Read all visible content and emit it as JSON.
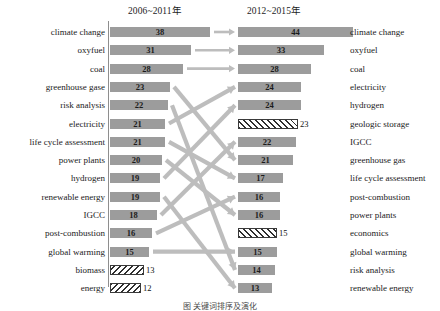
{
  "chart_data": {
    "type": "bar",
    "title": "",
    "subtitle": "",
    "xlabel": "",
    "ylabel": "",
    "grid": false,
    "legend_position": "none",
    "orientation": "horizontal",
    "layout": "slope-ranking-comparison",
    "panels": [
      {
        "name": "left",
        "header": "2006~2011年",
        "categories": [
          "climate change",
          "oxyfuel",
          "coal",
          "greenhouse gase",
          "risk analysis",
          "electricity",
          "life cycle assessment",
          "power plants",
          "hydrogen",
          "renewable energy",
          "IGCC",
          "post-combustion",
          "global warming",
          "biomass",
          "energy"
        ],
        "values": [
          38,
          31,
          28,
          23,
          22,
          21,
          21,
          20,
          19,
          19,
          18,
          16,
          15,
          13,
          12
        ],
        "styles": [
          "solid",
          "solid",
          "solid",
          "solid",
          "solid",
          "solid",
          "solid",
          "solid",
          "solid",
          "solid",
          "solid",
          "solid",
          "solid",
          "hatched",
          "hatched"
        ]
      },
      {
        "name": "right",
        "header": "2012~2015年",
        "categories": [
          "climate change",
          "oxyfuel",
          "coal",
          "electricity",
          "hydrogen",
          "geologic storage",
          "IGCC",
          "greenhouse gas",
          "life cycle assessment",
          "post-combustion",
          "power plants",
          "economics",
          "global warming",
          "risk analysis",
          "renewable energy"
        ],
        "values": [
          44,
          33,
          28,
          24,
          24,
          23,
          22,
          21,
          17,
          16,
          16,
          15,
          15,
          14,
          13
        ],
        "styles": [
          "solid",
          "solid",
          "solid",
          "solid",
          "solid",
          "solid",
          "solid",
          "solid",
          "solid",
          "solid",
          "solid",
          "hatched",
          "solid",
          "solid",
          "solid"
        ]
      }
    ],
    "links": [
      {
        "from": "climate change",
        "to": "climate change",
        "from_row": 0,
        "to_row": 0,
        "kind": "arrow"
      },
      {
        "from": "oxyfuel",
        "to": "oxyfuel",
        "from_row": 1,
        "to_row": 1,
        "kind": "arrow"
      },
      {
        "from": "coal",
        "to": "coal",
        "from_row": 2,
        "to_row": 2,
        "kind": "arrow"
      },
      {
        "from": "greenhouse gase",
        "to": "greenhouse gas",
        "from_row": 3,
        "to_row": 7,
        "kind": "ribbon"
      },
      {
        "from": "risk analysis",
        "to": "risk analysis",
        "from_row": 4,
        "to_row": 13,
        "kind": "ribbon"
      },
      {
        "from": "electricity",
        "to": "electricity",
        "from_row": 5,
        "to_row": 3,
        "kind": "ribbon"
      },
      {
        "from": "life cycle assessment",
        "to": "life cycle assessment",
        "from_row": 6,
        "to_row": 8,
        "kind": "ribbon"
      },
      {
        "from": "power plants",
        "to": "power plants",
        "from_row": 7,
        "to_row": 10,
        "kind": "ribbon"
      },
      {
        "from": "hydrogen",
        "to": "hydrogen",
        "from_row": 8,
        "to_row": 4,
        "kind": "ribbon"
      },
      {
        "from": "renewable energy",
        "to": "renewable energy",
        "from_row": 9,
        "to_row": 14,
        "kind": "ribbon"
      },
      {
        "from": "IGCC",
        "to": "IGCC",
        "from_row": 10,
        "to_row": 6,
        "kind": "ribbon"
      },
      {
        "from": "post-combustion",
        "to": "post-combustion",
        "from_row": 11,
        "to_row": 9,
        "kind": "ribbon"
      },
      {
        "from": "global warming",
        "to": "global warming",
        "from_row": 12,
        "to_row": 12,
        "kind": "ribbon"
      }
    ],
    "colors": {
      "bar_fill": "#9c9c9c",
      "link": "#bdbdbd",
      "hatch_stroke": "#2f2f2f",
      "axis": "#8e8e8e",
      "text": "#1a1a1a"
    },
    "notes": {
      "new_terms_right": [
        "geologic storage",
        "economics"
      ],
      "dropped_terms_left": [
        "biomass",
        "energy"
      ],
      "hatch_meaning": "hatched bars mark terms present in only one period"
    }
  },
  "headers": {
    "left": "2006~2011年",
    "right": "2012~2015年"
  },
  "rows_left": [
    {
      "label": "climate change",
      "value": "38",
      "style": "solid"
    },
    {
      "label": "oxyfuel",
      "value": "31",
      "style": "solid"
    },
    {
      "label": "coal",
      "value": "28",
      "style": "solid"
    },
    {
      "label": "greenhouse gase",
      "value": "23",
      "style": "solid"
    },
    {
      "label": "risk analysis",
      "value": "22",
      "style": "solid"
    },
    {
      "label": "electricity",
      "value": "21",
      "style": "solid"
    },
    {
      "label": "life cycle assessment",
      "value": "21",
      "style": "solid"
    },
    {
      "label": "power plants",
      "value": "20",
      "style": "solid"
    },
    {
      "label": "hydrogen",
      "value": "19",
      "style": "solid"
    },
    {
      "label": "renewable energy",
      "value": "19",
      "style": "solid"
    },
    {
      "label": "IGCC",
      "value": "18",
      "style": "solid"
    },
    {
      "label": "post-combustion",
      "value": "16",
      "style": "solid"
    },
    {
      "label": "global warming",
      "value": "15",
      "style": "solid"
    },
    {
      "label": "biomass",
      "value": "13",
      "style": "hatched"
    },
    {
      "label": "energy",
      "value": "12",
      "style": "hatched"
    }
  ],
  "rows_right": [
    {
      "label": "climate change",
      "value": "44",
      "style": "solid"
    },
    {
      "label": "oxyfuel",
      "value": "33",
      "style": "solid"
    },
    {
      "label": "coal",
      "value": "28",
      "style": "solid"
    },
    {
      "label": "electricity",
      "value": "24",
      "style": "solid"
    },
    {
      "label": "hydrogen",
      "value": "24",
      "style": "solid"
    },
    {
      "label": "geologic storage",
      "value": "23",
      "style": "hatched"
    },
    {
      "label": "IGCC",
      "value": "22",
      "style": "solid"
    },
    {
      "label": "greenhouse gas",
      "value": "21",
      "style": "solid"
    },
    {
      "label": "life cycle assessment",
      "value": "17",
      "style": "solid"
    },
    {
      "label": "post-combustion",
      "value": "16",
      "style": "solid"
    },
    {
      "label": "power plants",
      "value": "16",
      "style": "solid"
    },
    {
      "label": "economics",
      "value": "15",
      "style": "hatched"
    },
    {
      "label": "global warming",
      "value": "15",
      "style": "solid"
    },
    {
      "label": "risk analysis",
      "value": "14",
      "style": "solid"
    },
    {
      "label": "renewable energy",
      "value": "13",
      "style": "solid"
    }
  ],
  "caption": "图 关键词排序及演化"
}
